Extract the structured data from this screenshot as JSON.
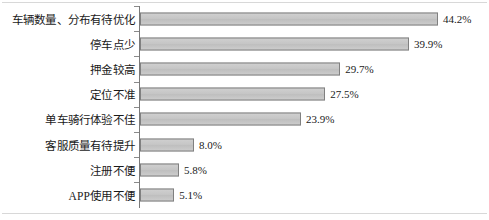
{
  "chart_data": {
    "type": "bar",
    "orientation": "horizontal",
    "title": "",
    "subtitle": "",
    "xlabel": "",
    "ylabel": "",
    "xlim": [
      0,
      44.2
    ],
    "grid": false,
    "legend": null,
    "value_suffix": "%",
    "categories": [
      "车辆数量、分布有待优化",
      "停车点少",
      "押金较高",
      "定位不准",
      "单车骑行体验不佳",
      "客服质量有待提升",
      "注册不便",
      "APP使用不便"
    ],
    "values": [
      44.2,
      39.9,
      29.7,
      27.5,
      23.9,
      8.0,
      5.8,
      5.1
    ],
    "value_labels": [
      "44.2%",
      "39.9%",
      "29.7%",
      "27.5%",
      "23.9%",
      "8.0%",
      "5.8%",
      "5.1%"
    ],
    "colors": {
      "bar_fill": "#c9c9c9",
      "bar_border": "#808080",
      "axis": "#7a7a7a",
      "frame": "#d8d8d8",
      "text": "#1a1a1a"
    }
  }
}
